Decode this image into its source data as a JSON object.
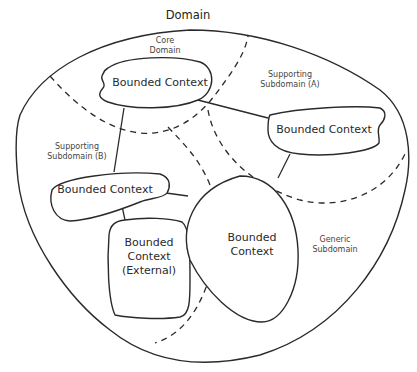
{
  "diagram": {
    "title": "Domain",
    "subdomains": [
      {
        "id": "core",
        "label_line1": "Core",
        "label_line2": "Domain"
      },
      {
        "id": "supporting_a",
        "label_line1": "Supporting",
        "label_line2": "Subdomain (A)"
      },
      {
        "id": "supporting_b",
        "label_line1": "Supporting",
        "label_line2": "Subdomain (B)"
      },
      {
        "id": "generic",
        "label_line1": "Generic",
        "label_line2": "Subdomain"
      }
    ],
    "bounded_contexts": [
      {
        "id": "bc_core",
        "label": "Bounded Context",
        "subdomain": "core"
      },
      {
        "id": "bc_supporting_a",
        "label": "Bounded Context",
        "subdomain": "supporting_a"
      },
      {
        "id": "bc_supporting_b",
        "label": "Bounded Context",
        "subdomain": "supporting_b"
      },
      {
        "id": "bc_external",
        "label_line1": "Bounded",
        "label_line2": "Context",
        "label_line3": "(External)",
        "subdomain": "supporting_b"
      },
      {
        "id": "bc_generic",
        "label_line1": "Bounded",
        "label_line2": "Context",
        "subdomain": "generic"
      }
    ],
    "connections": [
      {
        "from": "bc_core",
        "to": "bc_supporting_a"
      },
      {
        "from": "bc_core",
        "to": "bc_supporting_b"
      },
      {
        "from": "bc_supporting_b",
        "to": "bc_external"
      },
      {
        "from": "bc_supporting_b",
        "to": "bc_generic"
      },
      {
        "from": "bc_supporting_a",
        "to": "bc_generic"
      }
    ],
    "colors": {
      "stroke": "#2a2a2a",
      "background": "#ffffff",
      "text": "#333333"
    }
  }
}
